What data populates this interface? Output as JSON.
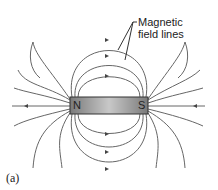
{
  "diagram": {
    "caption_line1": "Magnetic",
    "caption_line2": "field lines",
    "north_label": "N",
    "south_label": "S",
    "panel_label": "(a)",
    "colors": {
      "line": "#555555",
      "magnet_dark": "#7a7a7a",
      "magnet_light": "#c8c8c8"
    }
  }
}
